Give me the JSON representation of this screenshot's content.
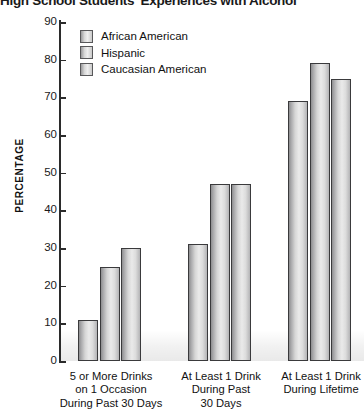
{
  "chart_data": {
    "type": "bar",
    "title": "High School Students' Experiences with Alcohol",
    "xlabel": "",
    "ylabel": "PERCENTAGE",
    "ylim": [
      0,
      90
    ],
    "ytick_step": 10,
    "yticks": [
      "90",
      "80",
      "70",
      "60",
      "50",
      "40",
      "30",
      "20",
      "10",
      "0"
    ],
    "grid": false,
    "legend_position": "top-left-inside",
    "categories": [
      "5 or More Drinks on 1 Occasion During Past 30 Days",
      "At Least 1 Drink During Past 30 Days",
      "At Least 1 Drink During Lifetime"
    ],
    "category_lines": [
      [
        "5 or More Drinks",
        "on 1 Occasion",
        "During Past 30 Days"
      ],
      [
        "At Least 1 Drink",
        "During Past",
        "30 Days"
      ],
      [
        "At Least 1 Drink",
        "During Lifetime"
      ]
    ],
    "series": [
      {
        "name": "African American",
        "values": [
          11,
          31,
          69
        ]
      },
      {
        "name": "Hispanic",
        "values": [
          25,
          47,
          79
        ]
      },
      {
        "name": "Caucasian American",
        "values": [
          30,
          47,
          75
        ]
      }
    ]
  },
  "legend": {
    "items": [
      {
        "label": "African American"
      },
      {
        "label": "Hispanic"
      },
      {
        "label": "Caucasian American"
      }
    ]
  },
  "colors": {
    "bar_edge": "#3a3a3c",
    "bar_fill_light": "#eaeaea",
    "bar_fill_dark": "#8e8e90",
    "axis": "#2b2b2b",
    "text": "#111111",
    "background": "#ffffff"
  }
}
